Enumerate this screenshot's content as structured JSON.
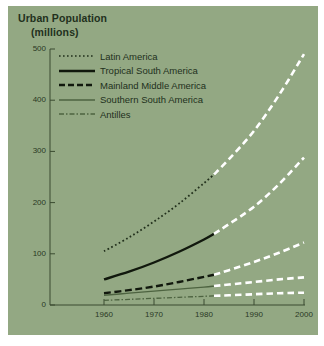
{
  "chart_data": {
    "type": "line",
    "title": "Urban Population",
    "subtitle": "(millions)",
    "xlabel": "",
    "ylabel": "Urban Population (millions)",
    "xlim": [
      1955,
      2000
    ],
    "ylim": [
      0,
      500
    ],
    "xticks": [
      "1960",
      "1970",
      "1980",
      "1990",
      "2000"
    ],
    "xtick_values": [
      1960,
      1970,
      1980,
      1990,
      2000
    ],
    "yticks": [
      "0",
      "100",
      "200",
      "300",
      "400",
      "500"
    ],
    "ytick_values": [
      0,
      100,
      200,
      300,
      400,
      500
    ],
    "grid": false,
    "legend_position": "upper-left-inside",
    "projection_starts": 1982,
    "projection_note": "Segments after 1982 are projections drawn as white dashed lines",
    "series": [
      {
        "name": "Latin America",
        "style": "dotted",
        "color": "#22301c",
        "projection_color": "#ffffff",
        "x": [
          1960,
          1965,
          1970,
          1975,
          1980,
          1982,
          1985,
          1990,
          1995,
          2000
        ],
        "values": [
          105,
          132,
          163,
          198,
          238,
          255,
          285,
          340,
          410,
          490
        ]
      },
      {
        "name": "Tropical South America",
        "style": "solid",
        "color": "#11180d",
        "projection_color": "#ffffff",
        "x": [
          1960,
          1965,
          1970,
          1975,
          1980,
          1982,
          1985,
          1990,
          1995,
          2000
        ],
        "values": [
          50,
          65,
          83,
          104,
          128,
          139,
          158,
          192,
          236,
          288
        ]
      },
      {
        "name": "Mainland Middle America",
        "style": "dashed",
        "color": "#11180d",
        "projection_color": "#ffffff",
        "x": [
          1960,
          1965,
          1970,
          1975,
          1980,
          1982,
          1985,
          1990,
          1995,
          2000
        ],
        "values": [
          23,
          29,
          36,
          45,
          55,
          59,
          68,
          84,
          102,
          122
        ]
      },
      {
        "name": "Southern South America",
        "style": "solid-thin",
        "color": "#4d6340",
        "projection_color": "#ffffff",
        "x": [
          1960,
          1965,
          1970,
          1975,
          1980,
          1982,
          1985,
          1990,
          1995,
          2000
        ],
        "values": [
          19,
          23,
          27,
          31,
          35,
          37,
          40,
          45,
          50,
          54
        ]
      },
      {
        "name": "Antilles",
        "style": "dash-dot",
        "color": "#4d6340",
        "projection_color": "#ffffff",
        "x": [
          1960,
          1965,
          1970,
          1975,
          1980,
          1982,
          1985,
          1990,
          1995,
          2000
        ],
        "values": [
          9,
          11,
          13,
          15,
          17,
          18,
          19,
          21,
          23,
          24
        ]
      }
    ]
  },
  "legend": {
    "items": [
      {
        "label": "Latin America",
        "swatch": "dotted-line-swatch"
      },
      {
        "label": "Tropical South America",
        "swatch": "solid-thick-line-swatch"
      },
      {
        "label": "Mainland Middle America",
        "swatch": "dashed-line-swatch"
      },
      {
        "label": "Southern South America",
        "swatch": "solid-thin-line-swatch"
      },
      {
        "label": "Antilles",
        "swatch": "dash-dot-line-swatch"
      }
    ]
  },
  "colors": {
    "panel_background": "#93a883",
    "page_background": "#ffffff",
    "axis": "#3a4a30",
    "text_dark": "#22301c",
    "series_dark": "#11180d",
    "series_green": "#4d6340",
    "projection": "#ffffff"
  }
}
